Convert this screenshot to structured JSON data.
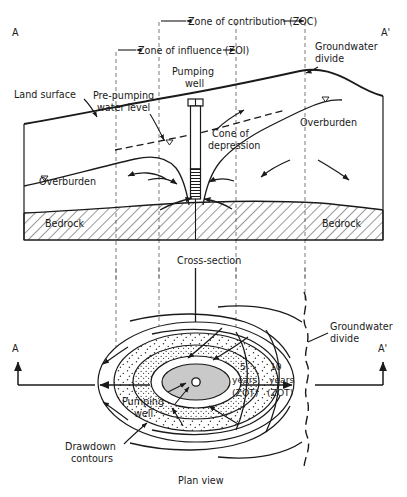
{
  "figure": {
    "background_color": "#ffffff",
    "line_color": "#1a1a1a"
  },
  "cross_section": {
    "caption": "Cross-section",
    "section_marker_left": "A",
    "section_marker_right": "A'",
    "zone_labels": [
      {
        "name": "zoc",
        "text": "Zone of contribution (ZOC)"
      },
      {
        "name": "zoi",
        "text": "Zone of influence (ZOI)"
      }
    ],
    "annotations": [
      {
        "name": "land-surface",
        "text": "Land surface"
      },
      {
        "name": "pre-pumping-water-level-line1",
        "text": "Pre-pumping"
      },
      {
        "name": "pre-pumping-water-level-line2",
        "text": "water level"
      },
      {
        "name": "pumping-well-line1",
        "text": "Pumping"
      },
      {
        "name": "pumping-well-line2",
        "text": "well"
      },
      {
        "name": "cone-of-depression-line1",
        "text": "Cone of"
      },
      {
        "name": "cone-of-depression-line2",
        "text": "depression"
      },
      {
        "name": "groundwater-divide-line1",
        "text": "Groundwater"
      },
      {
        "name": "groundwater-divide-line2",
        "text": "divide"
      },
      {
        "name": "overburden-left",
        "text": "Overburden"
      },
      {
        "name": "overburden-right",
        "text": "Overburden"
      },
      {
        "name": "bedrock-left",
        "text": "Bedrock"
      },
      {
        "name": "bedrock-right",
        "text": "Bedrock"
      }
    ]
  },
  "plan_view": {
    "caption": "Plan view",
    "section_marker_left": "A",
    "section_marker_right": "A'",
    "annotations": [
      {
        "name": "pumping-well-line1",
        "text": "Pumping"
      },
      {
        "name": "pumping-well-line2",
        "text": "well"
      },
      {
        "name": "drawdown-contours-line1",
        "text": "Drawdown"
      },
      {
        "name": "drawdown-contours-line2",
        "text": "contours"
      },
      {
        "name": "groundwater-divide-line1",
        "text": "Groundwater"
      },
      {
        "name": "groundwater-divide-line2",
        "text": "divide"
      }
    ],
    "zot_labels": [
      {
        "name": "zot-5-year",
        "value": "5",
        "unit": "years",
        "code": "(ZOT)"
      },
      {
        "name": "zot-10-year",
        "value": "10",
        "unit": "years",
        "code": "(ZOT)"
      }
    ]
  }
}
